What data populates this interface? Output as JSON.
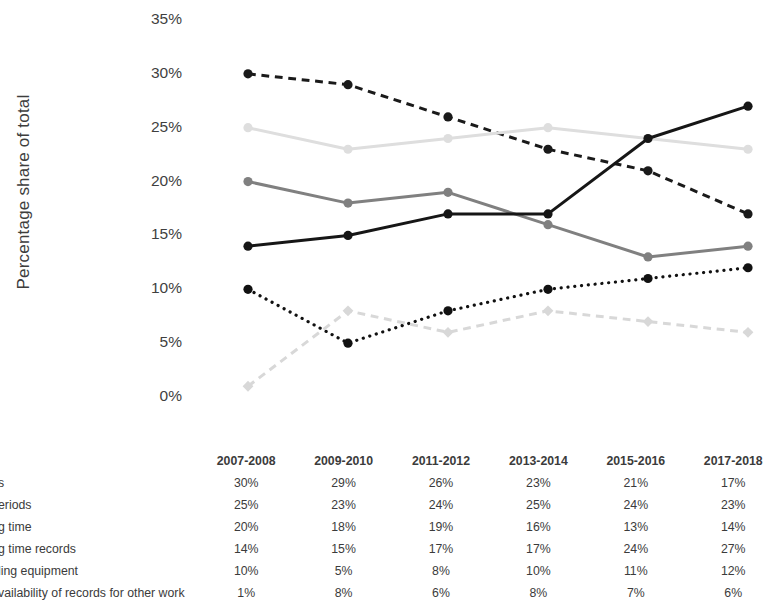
{
  "chart_data": {
    "type": "line",
    "title": "",
    "xlabel": "",
    "ylabel": "Percentage share of total",
    "categories": [
      "2007-2008",
      "2009-2010",
      "2011-2012",
      "2013-2014",
      "2015-2016",
      "2017-2018"
    ],
    "ylim": [
      0,
      35
    ],
    "ytick_labels": [
      "0%",
      "5%",
      "10%",
      "15%",
      "20%",
      "25%",
      "30%",
      "35%"
    ],
    "ytick_values": [
      0,
      5,
      10,
      15,
      20,
      25,
      30,
      35
    ],
    "grid": false,
    "legend": "none",
    "value_suffix": "%",
    "series": [
      {
        "name": "s",
        "values": [
          30,
          29,
          26,
          23,
          21,
          17
        ],
        "display_values": [
          "30%",
          "29%",
          "26%",
          "23%",
          "21%",
          "17%"
        ],
        "color": "#1a1a1a",
        "style": "dashed",
        "marker": "circle"
      },
      {
        "name": "eriods",
        "values": [
          25,
          23,
          24,
          25,
          24,
          23
        ],
        "display_values": [
          "25%",
          "23%",
          "24%",
          "25%",
          "24%",
          "23%"
        ],
        "color": "#dedede",
        "style": "solid",
        "marker": "circle"
      },
      {
        "name": "g time",
        "values": [
          20,
          18,
          19,
          16,
          13,
          14
        ],
        "display_values": [
          "20%",
          "18%",
          "19%",
          "16%",
          "13%",
          "14%"
        ],
        "color": "#808080",
        "style": "solid",
        "marker": "circle"
      },
      {
        "name": "g time records",
        "values": [
          14,
          15,
          17,
          17,
          24,
          27
        ],
        "display_values": [
          "14%",
          "15%",
          "17%",
          "17%",
          "24%",
          "27%"
        ],
        "color": "#161616",
        "style": "solid",
        "marker": "circle"
      },
      {
        "name": "ling equipment",
        "values": [
          10,
          5,
          8,
          10,
          11,
          12
        ],
        "display_values": [
          "10%",
          "5%",
          "8%",
          "10%",
          "11%",
          "12%"
        ],
        "color": "#111111",
        "style": "dotted",
        "marker": "circle"
      },
      {
        "name": "vailability of records for other work",
        "values": [
          1,
          8,
          6,
          8,
          7,
          6
        ],
        "display_values": [
          "1%",
          "8%",
          "6%",
          "8%",
          "7%",
          "6%"
        ],
        "color": "#d8d8d8",
        "style": "dashed",
        "marker": "diamond"
      }
    ]
  },
  "table": {
    "row_header_blank": "",
    "columns": [
      "2007-2008",
      "2009-2010",
      "2011-2012",
      "2013-2014",
      "2015-2016",
      "2017-2018"
    ],
    "rows": [
      {
        "label": "s",
        "values": [
          "30%",
          "29%",
          "26%",
          "23%",
          "21%",
          "17%"
        ]
      },
      {
        "label": "eriods",
        "values": [
          "25%",
          "23%",
          "24%",
          "25%",
          "24%",
          "23%"
        ]
      },
      {
        "label": "g time",
        "values": [
          "20%",
          "18%",
          "19%",
          "16%",
          "13%",
          "14%"
        ]
      },
      {
        "label": "g time records",
        "values": [
          "14%",
          "15%",
          "17%",
          "17%",
          "24%",
          "27%"
        ]
      },
      {
        "label": "ling equipment",
        "values": [
          "10%",
          "5%",
          "8%",
          "10%",
          "11%",
          "12%"
        ]
      },
      {
        "label": "vailability of records for other work",
        "values": [
          "1%",
          "8%",
          "6%",
          "8%",
          "7%",
          "6%"
        ]
      }
    ]
  }
}
